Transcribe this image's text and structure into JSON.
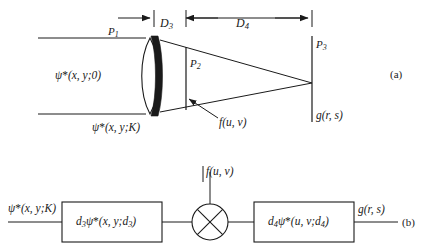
{
  "figure": {
    "ink_color": "#1a1a1a",
    "background_color": "#ffffff",
    "panels": [
      {
        "id": "a",
        "tag": "(a)",
        "description": "Optical layout with lens, filter plane and output plane"
      },
      {
        "id": "b",
        "tag": "(b)",
        "description": "Equivalent block diagram with multiplier"
      }
    ]
  },
  "panel_a": {
    "tag": "(a)",
    "dimensions": [
      {
        "name": "D3",
        "base": "D",
        "sub": "3"
      },
      {
        "name": "D4",
        "base": "D",
        "sub": "4"
      }
    ],
    "planes": [
      {
        "name": "P1",
        "base": "P",
        "sub": "1"
      },
      {
        "name": "P2",
        "base": "P",
        "sub": "2"
      },
      {
        "name": "P3",
        "base": "P",
        "sub": "3"
      }
    ],
    "input_field": {
      "psi": "ψ",
      "star": "*",
      "args": "(x, y;0)"
    },
    "lens_field": {
      "psi": "ψ",
      "star": "*",
      "args": "(x, y;K)"
    },
    "filter_label": {
      "base": "f",
      "args": "(u, v)"
    },
    "output_label": {
      "base": "g",
      "args": "(r, s)"
    }
  },
  "panel_b": {
    "tag": "(b)",
    "input_label": {
      "psi": "ψ",
      "star": "*",
      "args": "(x, y;K)"
    },
    "blocks": [
      {
        "id": "block-d3",
        "coef_base": "d",
        "coef_sub": "3",
        "psi": "ψ",
        "star": "*",
        "args_open": "(x, y;d",
        "args_sub": "3",
        "args_close": ")"
      },
      {
        "id": "block-d4",
        "coef_base": "d",
        "coef_sub": "4",
        "psi": "ψ",
        "star": "*",
        "args_open": "(u, v;d",
        "args_sub": "4",
        "args_close": ")"
      }
    ],
    "multiplier": {
      "symbol": "⊗",
      "name": "multiplier"
    },
    "filter_input": {
      "base": "f",
      "args": "(u, v)"
    },
    "output_label": {
      "base": "g",
      "args": "(r, s)"
    }
  }
}
